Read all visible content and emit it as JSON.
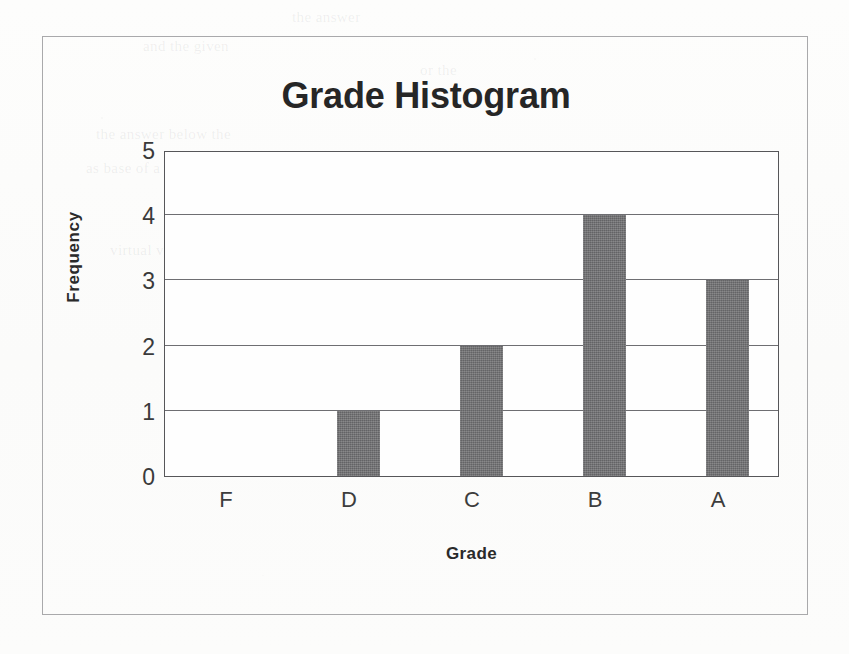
{
  "chart_data": {
    "type": "bar",
    "title": "Grade Histogram",
    "xlabel": "Grade",
    "ylabel": "Frequency",
    "categories": [
      "F",
      "D",
      "C",
      "B",
      "A"
    ],
    "values": [
      0,
      1,
      2,
      4,
      3
    ],
    "ylim": [
      0,
      5
    ],
    "yticks": [
      "0",
      "1",
      "2",
      "3",
      "4",
      "5"
    ],
    "ytick_values": [
      0,
      1,
      2,
      3,
      4,
      5
    ],
    "grid": true,
    "legend": "none",
    "bar_color": "#6f6f71",
    "plot_border_color": "#565659",
    "frame_border_color": "#a9a9ab",
    "background_color": "#fdfdfc",
    "text_color": "#2a2a2a"
  },
  "ghost_text": [
    {
      "text": "the answer",
      "x": 292,
      "y": 9
    },
    {
      "text": "and the given",
      "x": 143,
      "y": 38
    },
    {
      "text": "or the",
      "x": 420,
      "y": 62
    },
    {
      "text": "the answer below the",
      "x": 96,
      "y": 126
    },
    {
      "text": "as base of a cylinder of",
      "x": 86,
      "y": 160
    },
    {
      "text": "then a right circular",
      "x": 330,
      "y": 160
    },
    {
      "text": "cylinder",
      "x": 560,
      "y": 160
    },
    {
      "text": "virtual volume of that cylinder",
      "x": 110,
      "y": 242
    },
    {
      "text": "equal to",
      "x": 400,
      "y": 430
    },
    {
      "text": "the total",
      "x": 560,
      "y": 460
    }
  ]
}
